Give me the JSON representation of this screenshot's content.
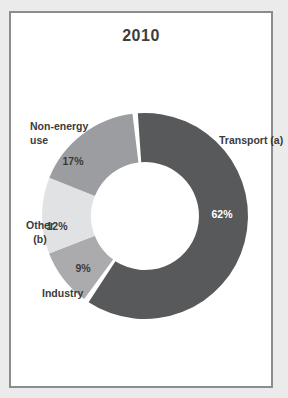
{
  "page": {
    "background_color": "#ecebec",
    "panel_border_color": "#8a8c8e",
    "panel_background": "#ffffff"
  },
  "chart_data": {
    "type": "pie",
    "subtype": "donut",
    "title": "2010",
    "unit": "%",
    "legend_position": "none",
    "grid": false,
    "center": {
      "x": 145,
      "y": 216
    },
    "outer_radius": 103,
    "inner_radius": 54,
    "start_angle_deg": -7,
    "explode_gap_deg": 3,
    "categories": [
      "Transport (a)",
      "Industry",
      "Other (b)",
      "Non-energy use"
    ],
    "values": [
      62,
      9,
      12,
      17
    ],
    "segments": [
      {
        "name": "Transport (a)",
        "value": 62,
        "color": "#58595b",
        "exploded": true,
        "pct_label": {
          "x": 222,
          "y": 214,
          "color": "#ffffff"
        }
      },
      {
        "name": "Industry",
        "value": 9,
        "color": "#ababad",
        "exploded": false,
        "pct_label": {
          "x": 83,
          "y": 268,
          "color": "#3a3a3a"
        }
      },
      {
        "name": "Other (b)",
        "value": 12,
        "color": "#e1e2e3",
        "exploded": false,
        "pct_label": {
          "x": 57,
          "y": 226,
          "color": "#3a3a3a"
        }
      },
      {
        "name": "Non-energy use",
        "value": 17,
        "color": "#9b9da0",
        "exploded": false,
        "pct_label": {
          "x": 73,
          "y": 161,
          "color": "#3a3a3a"
        }
      }
    ],
    "category_labels": [
      {
        "segment": "Transport (a)",
        "lines": [
          "Transport (a)"
        ],
        "x": 219,
        "y": 133,
        "align": "left"
      },
      {
        "segment": "Industry",
        "lines": [
          "Industry"
        ],
        "x": 42,
        "y": 286,
        "align": "left"
      },
      {
        "segment": "Other (b)",
        "lines": [
          "Other",
          "(b)"
        ],
        "x": 40,
        "y": 218,
        "align": "center"
      },
      {
        "segment": "Non-energy use",
        "lines": [
          "Non-energy",
          "use"
        ],
        "x": 30,
        "y": 119,
        "align": "left"
      }
    ]
  }
}
